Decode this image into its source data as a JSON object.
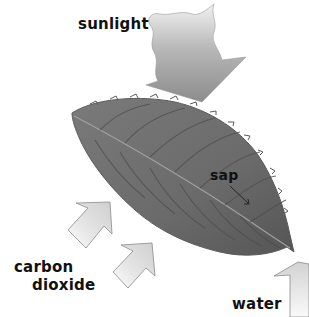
{
  "diagram": {
    "labels": {
      "sunlight": "sunlight",
      "sap": "sap",
      "carbon_dioxide_line1": "carbon",
      "carbon_dioxide_line2": "dioxide",
      "water": "water"
    },
    "colors": {
      "leaf": "#6e6e6e",
      "leaf_dark": "#4a4a4a",
      "vein": "#9a9a9a",
      "arrow_light": "#e4e4e4",
      "arrow_dark": "#8a8a8a",
      "text": "#111111"
    }
  }
}
